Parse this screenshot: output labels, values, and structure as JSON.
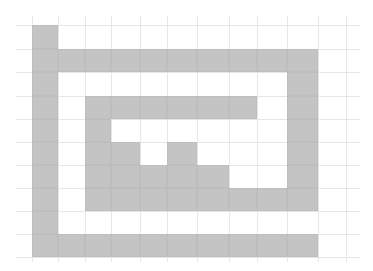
{
  "figure": {
    "type": "grid-maze",
    "rows": 10,
    "cols": 11,
    "fill_color": "#c4c4c4",
    "grid_line_color": "#e6e6e6",
    "background": "#ffffff",
    "col_edges": [
      32,
      58,
      85,
      111,
      140,
      167,
      197,
      229,
      257,
      287,
      318,
      346
    ],
    "row_edges": [
      25,
      49,
      72,
      96,
      119,
      142,
      165,
      188,
      211,
      234,
      257
    ],
    "cells": [
      [
        1,
        0,
        0,
        0,
        0,
        0,
        0,
        0,
        0,
        0,
        0
      ],
      [
        1,
        1,
        1,
        1,
        1,
        1,
        1,
        1,
        1,
        1,
        0
      ],
      [
        1,
        0,
        0,
        0,
        0,
        0,
        0,
        0,
        0,
        1,
        0
      ],
      [
        1,
        0,
        1,
        1,
        1,
        1,
        1,
        1,
        0,
        1,
        0
      ],
      [
        1,
        0,
        1,
        0,
        0,
        0,
        0,
        0,
        0,
        1,
        0
      ],
      [
        1,
        0,
        1,
        1,
        0,
        1,
        0,
        0,
        0,
        1,
        0
      ],
      [
        1,
        0,
        1,
        1,
        1,
        1,
        1,
        0,
        0,
        1,
        0
      ],
      [
        1,
        0,
        1,
        1,
        1,
        1,
        1,
        1,
        1,
        1,
        0
      ],
      [
        1,
        0,
        0,
        0,
        0,
        0,
        0,
        0,
        0,
        0,
        0
      ],
      [
        1,
        1,
        1,
        1,
        1,
        1,
        1,
        1,
        1,
        1,
        0
      ]
    ]
  }
}
